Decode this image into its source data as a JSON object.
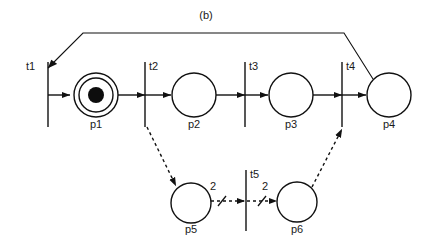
{
  "figure": {
    "caption": "(b)",
    "caption_x": 206,
    "caption_y": 18,
    "width": 432,
    "height": 244,
    "background_color": "#ffffff",
    "ink_color": "#111111"
  },
  "diagram": {
    "type": "petri-net",
    "places": [
      {
        "id": "p1",
        "label": "p1",
        "cx": 96,
        "cy": 95,
        "r": 22,
        "double_ring": true,
        "inner_r": 17,
        "tokens": 1,
        "token_r": 8,
        "label_x": 96,
        "label_y": 128
      },
      {
        "id": "p2",
        "label": "p2",
        "cx": 194,
        "cy": 95,
        "r": 22,
        "double_ring": false,
        "inner_r": 0,
        "tokens": 0,
        "token_r": 0,
        "label_x": 194,
        "label_y": 128
      },
      {
        "id": "p3",
        "label": "p3",
        "cx": 291,
        "cy": 95,
        "r": 22,
        "double_ring": false,
        "inner_r": 0,
        "tokens": 0,
        "token_r": 0,
        "label_x": 291,
        "label_y": 128
      },
      {
        "id": "p4",
        "label": "p4",
        "cx": 389,
        "cy": 95,
        "r": 22,
        "double_ring": false,
        "inner_r": 0,
        "tokens": 0,
        "token_r": 0,
        "label_x": 389,
        "label_y": 128
      },
      {
        "id": "p5",
        "label": "p5",
        "cx": 191,
        "cy": 203,
        "r": 20,
        "double_ring": false,
        "inner_r": 0,
        "tokens": 0,
        "token_r": 0,
        "label_x": 191,
        "label_y": 233
      },
      {
        "id": "p6",
        "label": "p6",
        "cx": 297,
        "cy": 202,
        "r": 20,
        "double_ring": false,
        "inner_r": 0,
        "tokens": 0,
        "token_r": 0,
        "label_x": 297,
        "label_y": 233
      }
    ],
    "transitions": [
      {
        "id": "t1",
        "label": "t1",
        "x": 48,
        "y_top": 62,
        "y_bottom": 127,
        "label_x": 26,
        "label_y": 70
      },
      {
        "id": "t2",
        "label": "t2",
        "x": 145,
        "y_top": 62,
        "y_bottom": 127,
        "label_x": 150,
        "label_y": 70
      },
      {
        "id": "t3",
        "label": "t3",
        "x": 245,
        "y_top": 62,
        "y_bottom": 127,
        "label_x": 250,
        "label_y": 70
      },
      {
        "id": "t4",
        "label": "t4",
        "x": 342,
        "y_top": 62,
        "y_bottom": 127,
        "label_x": 347,
        "label_y": 70
      },
      {
        "id": "t5",
        "label": "t5",
        "x": 246,
        "y_top": 170,
        "y_bottom": 231,
        "label_x": 251,
        "label_y": 178
      }
    ],
    "arcs": [
      {
        "id": "arc-t1-p1",
        "from": "t1",
        "to": "p1",
        "style": "solid",
        "weight": null,
        "path": "M 48 95 L 72 95"
      },
      {
        "id": "arc-p1-t2",
        "from": "p1",
        "to": "t2",
        "style": "solid",
        "weight": null,
        "path": "M 118 95 L 145 95"
      },
      {
        "id": "arc-t2-p2",
        "from": "t2",
        "to": "p2",
        "style": "solid",
        "weight": null,
        "path": "M 145 95 L 170 95"
      },
      {
        "id": "arc-p2-t3",
        "from": "p2",
        "to": "t3",
        "style": "solid",
        "weight": null,
        "path": "M 216 95 L 245 95"
      },
      {
        "id": "arc-t3-p3",
        "from": "t3",
        "to": "p3",
        "style": "solid",
        "weight": null,
        "path": "M 245 95 L 267 95"
      },
      {
        "id": "arc-p3-t4",
        "from": "p3",
        "to": "t4",
        "style": "solid",
        "weight": null,
        "path": "M 313 95 L 342 95"
      },
      {
        "id": "arc-t4-p4",
        "from": "t4",
        "to": "p4",
        "style": "solid",
        "weight": null,
        "path": "M 342 95 L 365 95"
      },
      {
        "id": "arc-t2-p5",
        "from": "t2",
        "to": "p5",
        "style": "dashed",
        "weight": null,
        "path": "M 147 127 L 177 189"
      },
      {
        "id": "arc-p6-t4",
        "from": "p6",
        "to": "t4",
        "style": "dashed",
        "weight": null,
        "path": "M 311 188 L 341 128"
      },
      {
        "id": "arc-p5-t5",
        "from": "p5",
        "to": "t5",
        "style": "dashed-weighted",
        "weight": "2",
        "weight_x": 213,
        "weight_y": 188,
        "path": "M 211 201 L 246 201"
      },
      {
        "id": "arc-t5-p6",
        "from": "t5",
        "to": "p6",
        "style": "dashed-weighted",
        "weight": "2",
        "weight_x": 265,
        "weight_y": 188,
        "path": "M 246 201 L 277 201"
      },
      {
        "id": "arc-p4-t1-feedback",
        "from": "p4",
        "to": "t1",
        "style": "feedback",
        "weight": null,
        "path": "M 373 79 L 344 33 L 83 33 L 48 68"
      }
    ]
  }
}
